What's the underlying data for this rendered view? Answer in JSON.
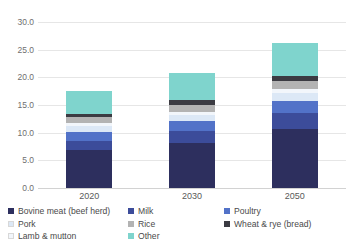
{
  "chart_data": {
    "type": "bar",
    "stacked": true,
    "title": "",
    "xlabel": "",
    "ylabel": "",
    "categories": [
      "2020",
      "2030",
      "2050"
    ],
    "ylim": [
      0.0,
      30.0
    ],
    "ytick_step": 5.0,
    "yticks": [
      "0.0",
      "5.0",
      "10.0",
      "15.0",
      "20.0",
      "25.0",
      "30.0"
    ],
    "ytick_values": [
      0.0,
      5.0,
      10.0,
      15.0,
      20.0,
      25.0,
      30.0
    ],
    "grid": "horizontal",
    "legend_position": "bottom",
    "totals": [
      17.6,
      20.8,
      26.2
    ],
    "series": [
      {
        "name": "Bovine meat (beef herd)",
        "color": "#2d2f5e",
        "values": [
          6.9,
          8.2,
          10.6
        ]
      },
      {
        "name": "Milk",
        "color": "#3c4c9a",
        "values": [
          1.6,
          2.1,
          2.9
        ]
      },
      {
        "name": "Poultry",
        "color": "#5272c8",
        "values": [
          1.7,
          1.8,
          2.3
        ]
      },
      {
        "name": "Pork",
        "color": "#dce8f6",
        "values": [
          1.0,
          1.1,
          1.4
        ]
      },
      {
        "name": "Lamb & mutton",
        "color": "#f2f6fb",
        "values": [
          0.5,
          0.6,
          0.7
        ]
      },
      {
        "name": "Rice",
        "color": "#b3b3b3",
        "values": [
          1.1,
          1.3,
          1.5
        ]
      },
      {
        "name": "Wheat & rye (bread)",
        "color": "#3b3b42",
        "values": [
          0.6,
          0.8,
          0.9
        ]
      },
      {
        "name": "Other",
        "color": "#7fd4cd",
        "values": [
          4.2,
          4.9,
          5.9
        ]
      }
    ]
  },
  "legend": {
    "columns": [
      [
        {
          "label": "Bovine meat (beef herd)",
          "color": "#2d2f5e"
        },
        {
          "label": "Pork",
          "color": "#dce8f6"
        },
        {
          "label": "Lamb & mutton",
          "color": "#f2f6fb"
        }
      ],
      [
        {
          "label": "Milk",
          "color": "#3c4c9a"
        },
        {
          "label": "Rice",
          "color": "#b3b3b3"
        },
        {
          "label": "Other",
          "color": "#7fd4cd"
        }
      ],
      [
        {
          "label": "Poultry",
          "color": "#5272c8"
        },
        {
          "label": "Wheat & rye (bread)",
          "color": "#3b3b42"
        }
      ]
    ]
  }
}
